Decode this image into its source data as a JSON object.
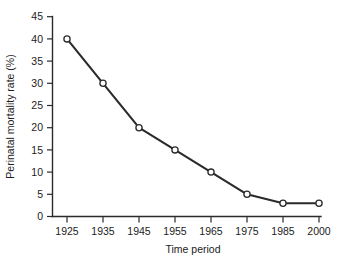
{
  "chart_data": {
    "type": "line",
    "title": "",
    "xlabel": "Time period",
    "ylabel": "Perinatal mortality rate (%)",
    "categories": [
      "1925",
      "1935",
      "1945",
      "1955",
      "1965",
      "1975",
      "1985",
      "2000"
    ],
    "values": [
      40,
      30,
      20,
      15,
      10,
      5,
      3,
      3
    ],
    "ylim": [
      0,
      45
    ],
    "yticks": [
      0,
      5,
      10,
      15,
      20,
      25,
      30,
      35,
      40,
      45
    ],
    "ytick_labels": [
      "0",
      "5",
      "10",
      "15",
      "20",
      "25",
      "30",
      "35",
      "40",
      "45"
    ],
    "xtick_labels": [
      "1925",
      "1935",
      "1945",
      "1955",
      "1965",
      "1975",
      "1985",
      "2000"
    ],
    "grid": false,
    "legend": null,
    "marker": "open-circle",
    "line_color": "#2a2a2a",
    "marker_face_color": "#ffffff",
    "series": [
      {
        "name": "Perinatal mortality rate",
        "values": [
          40,
          30,
          20,
          15,
          10,
          5,
          3,
          3
        ]
      }
    ],
    "points": [
      {
        "x": "1925",
        "y": 40
      },
      {
        "x": "1935",
        "y": 30
      },
      {
        "x": "1945",
        "y": 20
      },
      {
        "x": "1955",
        "y": 15
      },
      {
        "x": "1965",
        "y": 10
      },
      {
        "x": "1975",
        "y": 5
      },
      {
        "x": "1985",
        "y": 3
      },
      {
        "x": "2000",
        "y": 3
      }
    ]
  },
  "caption": {
    "fragment": ""
  }
}
